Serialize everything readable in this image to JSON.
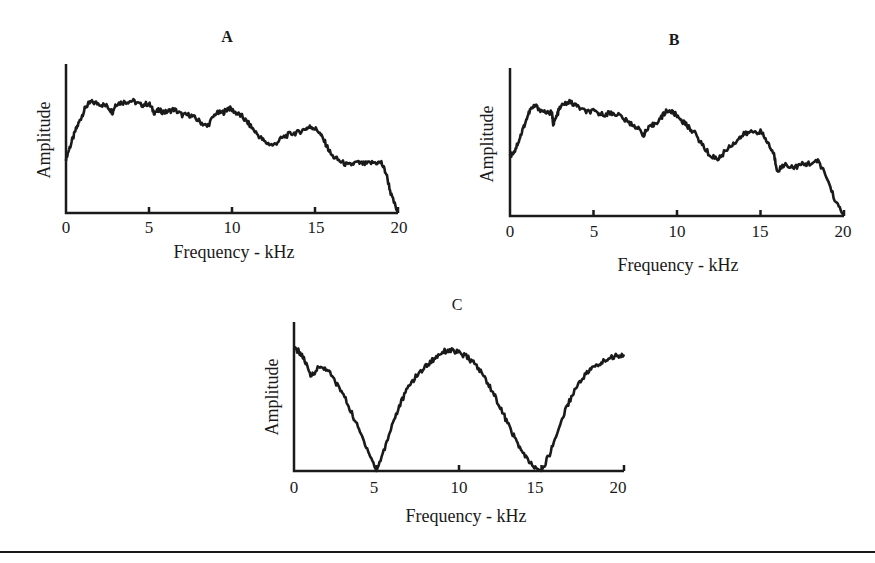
{
  "chart_data": [
    {
      "type": "line",
      "panel": "A",
      "title": "A",
      "xlabel": "Frequency - kHz",
      "ylabel": "Amplitude",
      "xlim": [
        0,
        20
      ],
      "ylim": [
        0,
        1
      ],
      "xticks": [
        0,
        5,
        10,
        15,
        20
      ],
      "yticks": [],
      "grid": false,
      "legend": null,
      "series": [
        {
          "name": "A",
          "x": [
            0,
            0.3,
            0.6,
            0.9,
            1.2,
            1.5,
            2.0,
            2.5,
            2.8,
            3.0,
            3.5,
            4.0,
            4.5,
            5.0,
            5.3,
            5.6,
            6.0,
            6.5,
            7.0,
            7.5,
            8.0,
            8.5,
            9.0,
            9.5,
            9.8,
            10.2,
            10.6,
            11.0,
            11.5,
            12.0,
            12.5,
            13.0,
            13.5,
            14.0,
            14.5,
            14.8,
            15.2,
            15.6,
            16.0,
            16.5,
            17.0,
            17.5,
            18.0,
            18.5,
            19.0,
            19.3,
            19.6,
            20.0
          ],
          "y": [
            0.38,
            0.48,
            0.58,
            0.66,
            0.74,
            0.77,
            0.76,
            0.74,
            0.7,
            0.76,
            0.77,
            0.78,
            0.75,
            0.76,
            0.7,
            0.71,
            0.7,
            0.72,
            0.68,
            0.68,
            0.64,
            0.6,
            0.69,
            0.7,
            0.73,
            0.7,
            0.67,
            0.62,
            0.55,
            0.49,
            0.47,
            0.52,
            0.55,
            0.56,
            0.59,
            0.6,
            0.57,
            0.49,
            0.4,
            0.36,
            0.33,
            0.35,
            0.34,
            0.35,
            0.35,
            0.27,
            0.12,
            0.0
          ]
        }
      ]
    },
    {
      "type": "line",
      "panel": "B",
      "title": "B",
      "xlabel": "Frequency - kHz",
      "ylabel": "Amplitude",
      "xlim": [
        0,
        20
      ],
      "ylim": [
        0,
        1
      ],
      "xticks": [
        0,
        5,
        10,
        15,
        20
      ],
      "yticks": [],
      "grid": false,
      "legend": null,
      "series": [
        {
          "name": "B",
          "x": [
            0,
            0.3,
            0.6,
            0.9,
            1.2,
            1.5,
            2.0,
            2.5,
            2.6,
            2.8,
            3.0,
            3.5,
            4.0,
            4.5,
            5.0,
            5.5,
            6.0,
            6.5,
            7.0,
            7.5,
            8.0,
            8.2,
            8.6,
            9.0,
            9.4,
            9.8,
            10.2,
            10.6,
            11.0,
            11.5,
            12.0,
            12.5,
            13.0,
            13.5,
            14.0,
            14.5,
            15.0,
            15.4,
            15.8,
            16.0,
            16.5,
            17.0,
            17.5,
            18.0,
            18.5,
            19.0,
            19.5,
            20.0
          ],
          "y": [
            0.42,
            0.46,
            0.55,
            0.65,
            0.74,
            0.77,
            0.73,
            0.72,
            0.64,
            0.7,
            0.76,
            0.8,
            0.77,
            0.73,
            0.73,
            0.71,
            0.72,
            0.71,
            0.66,
            0.63,
            0.57,
            0.6,
            0.64,
            0.68,
            0.74,
            0.72,
            0.68,
            0.63,
            0.59,
            0.5,
            0.42,
            0.4,
            0.47,
            0.52,
            0.57,
            0.59,
            0.59,
            0.52,
            0.43,
            0.32,
            0.36,
            0.34,
            0.36,
            0.37,
            0.38,
            0.26,
            0.1,
            0.0
          ]
        }
      ]
    },
    {
      "type": "line",
      "panel": "C",
      "title": "C",
      "xlabel": "Frequency - kHz",
      "ylabel": "Amplitude",
      "xlim": [
        0,
        20
      ],
      "ylim": [
        0,
        1
      ],
      "xticks": [
        0,
        5,
        10,
        15,
        20
      ],
      "yticks": [],
      "grid": false,
      "legend": null,
      "series": [
        {
          "name": "C",
          "x": [
            0,
            0.3,
            0.6,
            1.0,
            1.5,
            2.0,
            2.5,
            3.0,
            3.5,
            4.0,
            4.5,
            5.0,
            5.5,
            6.0,
            6.5,
            7.0,
            7.5,
            8.0,
            8.5,
            9.0,
            9.5,
            10.0,
            10.5,
            11.0,
            11.5,
            12.0,
            12.5,
            13.0,
            13.5,
            14.0,
            14.5,
            15.0,
            15.5,
            16.0,
            16.5,
            17.0,
            17.5,
            18.0,
            18.5,
            19.0,
            19.5,
            20.0
          ],
          "y": [
            0.85,
            0.83,
            0.78,
            0.66,
            0.72,
            0.71,
            0.62,
            0.53,
            0.4,
            0.27,
            0.14,
            0.0,
            0.16,
            0.34,
            0.48,
            0.6,
            0.67,
            0.73,
            0.78,
            0.83,
            0.84,
            0.82,
            0.79,
            0.74,
            0.66,
            0.56,
            0.44,
            0.32,
            0.2,
            0.1,
            0.03,
            0.0,
            0.12,
            0.28,
            0.44,
            0.56,
            0.65,
            0.71,
            0.74,
            0.78,
            0.8,
            0.81
          ]
        }
      ]
    }
  ],
  "panels": {
    "a": {
      "title": "A",
      "xlabel": "Frequency - kHz",
      "ylabel": "Amplitude",
      "ticks": [
        "0",
        "5",
        "10",
        "15",
        "20"
      ]
    },
    "b": {
      "title": "B",
      "xlabel": "Frequency - kHz",
      "ylabel": "Amplitude",
      "ticks": [
        "0",
        "5",
        "10",
        "15",
        "20"
      ]
    },
    "c": {
      "title": "C",
      "xlabel": "Frequency - kHz",
      "ylabel": "Amplitude",
      "ticks": [
        "0",
        "5",
        "10",
        "15",
        "20"
      ]
    }
  },
  "colors": {
    "ink": "#1a1a1a",
    "background": "#ffffff"
  }
}
